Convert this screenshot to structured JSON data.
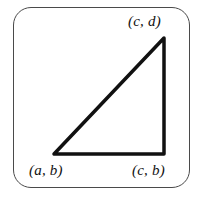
{
  "figure": {
    "kind": "right-triangle-coordinate-diagram",
    "frame": {
      "shape": "rounded-rectangle",
      "x": 13,
      "y": 7,
      "width": 177,
      "height": 181,
      "corner_radius": 18,
      "stroke_color": "#4a4a4a",
      "stroke_width": 1.5,
      "fill_color": "#ffffff"
    },
    "triangle": {
      "stroke_color": "#111111",
      "stroke_width": 3.5,
      "line_cap": "round",
      "fill": "none",
      "vertices": [
        {
          "id": "bottom-left",
          "label": "(a, b)",
          "x": 54,
          "y": 154
        },
        {
          "id": "bottom-right",
          "label": "(c, b)",
          "x": 164,
          "y": 154
        },
        {
          "id": "apex",
          "label": "(c, d)",
          "x": 164,
          "y": 38
        }
      ],
      "edges": [
        {
          "id": "base",
          "from": "bottom-left",
          "to": "bottom-right"
        },
        {
          "id": "vertical",
          "from": "bottom-right",
          "to": "apex"
        },
        {
          "id": "hypotenuse",
          "from": "apex",
          "to": "bottom-left"
        }
      ]
    },
    "labels": {
      "apex": "(c, d)",
      "bottom_left": "(a, b)",
      "bottom_right": "(c, b)"
    }
  }
}
